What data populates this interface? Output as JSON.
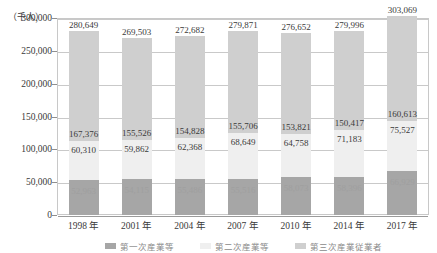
{
  "axis": {
    "unit_caption": "（千人）",
    "y_ticks": [
      "300,000",
      "250,000",
      "200,000",
      "150,000",
      "100,000",
      "50,000",
      "0"
    ]
  },
  "legend": {
    "items": [
      {
        "label": "第一次産業等",
        "color": "#a6a6a6"
      },
      {
        "label": "第二次産業等",
        "color": "#efefef"
      },
      {
        "label": "第三次産業従業者",
        "color": "#cfcfcf"
      }
    ]
  },
  "colors": {
    "segment_bottom": "#a6a6a6",
    "segment_middle": "#efefef",
    "segment_top": "#cfcfcf",
    "gridline": "#c9c9c9",
    "frame": "#c8c8c8",
    "text": "#3a3a3a"
  },
  "chart_data": {
    "type": "bar",
    "subtype": "stacked-column",
    "title": "",
    "xlabel": "",
    "ylabel": "（千人）",
    "ylim": [
      0,
      300000
    ],
    "ytick_step": 50000,
    "grid": true,
    "legend_position": "bottom",
    "categories": [
      "1998 年",
      "2001 年",
      "2004 年",
      "2007 年",
      "2010 年",
      "2014 年",
      "2017 年"
    ],
    "series": [
      {
        "name": "第一次産業等",
        "stack_position": "bottom",
        "color": "#a6a6a6",
        "values": [
          52963,
          54115,
          55486,
          55516,
          58073,
          58396,
          66929
        ],
        "labels": [
          "52,963",
          "54,115",
          "55,486",
          "55,516",
          "58,073",
          "58,396",
          "66,929"
        ]
      },
      {
        "name": "第二次産業等",
        "stack_position": "middle",
        "color": "#efefef",
        "values": [
          60310,
          59862,
          62368,
          68649,
          64758,
          71183,
          75527
        ],
        "labels": [
          "60,310",
          "59,862",
          "62,368",
          "68,649",
          "64,758",
          "71,183",
          "75,527"
        ]
      },
      {
        "name": "第三次産業従業者",
        "stack_position": "top",
        "color": "#cfcfcf",
        "values": [
          167376,
          155526,
          154828,
          155706,
          153821,
          150417,
          160613
        ],
        "labels": [
          "167,376",
          "155,526",
          "154,828",
          "155,706",
          "153,821",
          "150,417",
          "160,613"
        ]
      }
    ],
    "totals": [
      280649,
      269503,
      272682,
      279871,
      276652,
      279996,
      303069
    ],
    "total_labels": [
      "280,649",
      "269,503",
      "272,682",
      "279,871",
      "276,652",
      "279,996",
      "303,069"
    ]
  }
}
